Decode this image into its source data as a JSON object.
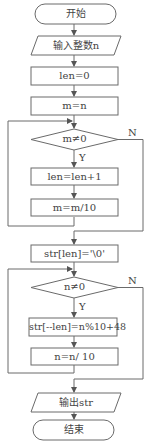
{
  "diagram": {
    "type": "flowchart",
    "colors": {
      "line": "#606060",
      "text": "#444444",
      "background": "#ffffff"
    },
    "nodes": {
      "start": {
        "shape": "terminal",
        "label": "开始"
      },
      "input": {
        "shape": "io",
        "label": "输入整数n"
      },
      "init_len": {
        "shape": "process",
        "label": "len=0"
      },
      "init_m": {
        "shape": "process",
        "label": "m=n"
      },
      "cond1": {
        "shape": "decision",
        "label": "m≠0"
      },
      "inc_len": {
        "shape": "process",
        "label": "len=len+1"
      },
      "div_m": {
        "shape": "process",
        "label": "m=m/10"
      },
      "terminate_str": {
        "shape": "process",
        "label": "str[len]='\\0'"
      },
      "cond2": {
        "shape": "decision",
        "label": "n≠0"
      },
      "store_digit": {
        "shape": "process",
        "label": "str[--len]=n%10+48"
      },
      "div_n": {
        "shape": "process",
        "label": "n=n/ 10"
      },
      "output": {
        "shape": "io",
        "label": "输出str"
      },
      "end": {
        "shape": "terminal",
        "label": "结束"
      }
    },
    "branch_labels": {
      "cond1_yes": "Y",
      "cond1_no": "N",
      "cond2_yes": "Y",
      "cond2_no": "N"
    }
  }
}
